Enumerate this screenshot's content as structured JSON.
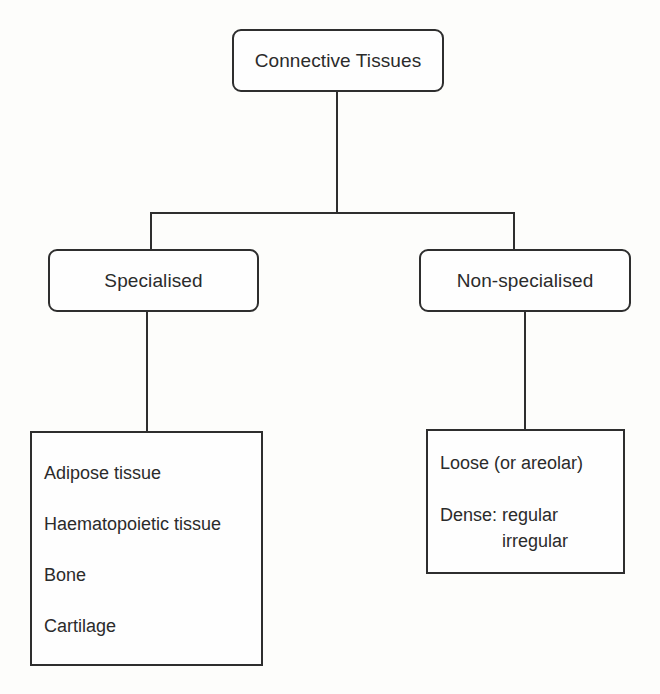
{
  "diagram": {
    "root": {
      "label": "Connective Tissues"
    },
    "branches": [
      {
        "label": "Specialised",
        "items": [
          "Adipose tissue",
          "Haematopoietic tissue",
          "Bone",
          "Cartilage"
        ]
      },
      {
        "label": "Non-specialised",
        "items": [
          "Loose (or areolar)"
        ],
        "dense": {
          "label": "Dense:",
          "values": [
            "regular",
            "irregular"
          ]
        }
      }
    ]
  },
  "colors": {
    "line": "#2e2e2e",
    "text": "#2b2b2b",
    "background": "#fdfdfb"
  }
}
